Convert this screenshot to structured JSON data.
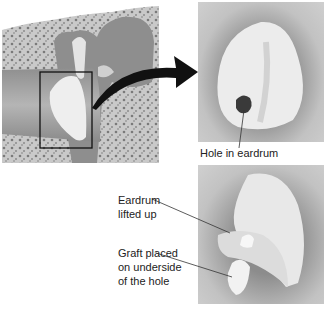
{
  "figure": {
    "panels": [
      {
        "id": "ear-cross-section",
        "description": "Cross-section of ear canal and middle ear with highlighted box around eardrum"
      },
      {
        "id": "eardrum-with-hole",
        "description": "Close-up of eardrum showing hole"
      },
      {
        "id": "graft-placement",
        "description": "Eardrum lifted up with graft placed on underside of hole"
      }
    ],
    "labels": {
      "hole": "Hole in eardrum",
      "lifted_line1": "Eardrum",
      "lifted_line2": "lifted up",
      "graft_line1": "Graft placed",
      "graft_line2": "on underside",
      "graft_line3": "of the hole"
    },
    "icons": {
      "arrow": "curved-arrow-right"
    },
    "colors": {
      "background": "#ffffff",
      "panel_gray": "#b8b8b8",
      "eardrum": "#ececec",
      "hole": "#3a3a3a",
      "bone": "#9a9a9a",
      "arrow": "#111111"
    }
  }
}
